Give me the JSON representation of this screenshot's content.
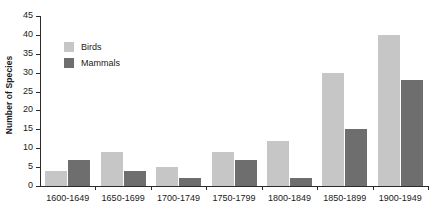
{
  "chart_data": {
    "type": "bar",
    "title": "",
    "xlabel": "",
    "ylabel": "Number of Species",
    "categories": [
      "1600-1649",
      "1650-1699",
      "1700-1749",
      "1750-1799",
      "1800-1849",
      "1850-1899",
      "1900-1949"
    ],
    "series": [
      {
        "name": "Birds",
        "color": "#c6c6c6",
        "values": [
          4,
          9,
          5,
          9,
          12,
          30,
          40
        ]
      },
      {
        "name": "Mammals",
        "color": "#6e6e6e",
        "values": [
          7,
          4,
          2,
          7,
          2,
          15,
          28
        ]
      }
    ],
    "ylim": [
      0,
      45
    ],
    "ytick_labels": [
      "0",
      "5",
      "10",
      "15",
      "20",
      "25",
      "30",
      "35",
      "40",
      "45"
    ],
    "ytick_values": [
      0,
      5,
      10,
      15,
      20,
      25,
      30,
      35,
      40,
      45
    ],
    "grid": false,
    "legend_position": "upper-left-inside",
    "annotations": []
  },
  "legend": {
    "items": [
      {
        "label": "Birds",
        "swatch": "birds"
      },
      {
        "label": "Mammals",
        "swatch": "mammals"
      }
    ]
  },
  "axis": {
    "y_title": "Number of Species"
  }
}
